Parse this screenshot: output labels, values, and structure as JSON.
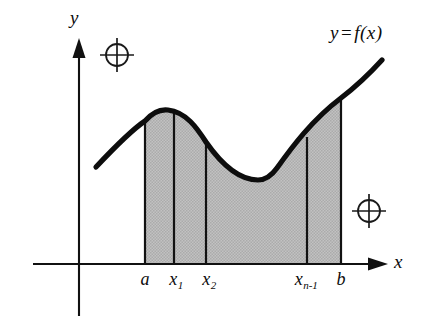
{
  "figure": {
    "background_color": "#ffffff",
    "ink_color": "#111111",
    "shade_color": "#b9b9b9"
  },
  "axes": {
    "y_label": "y",
    "x_label": "x",
    "origin": {
      "x": 79,
      "y": 264
    },
    "x_axis": {
      "x_start": 33,
      "x_end": 388,
      "y": 264
    },
    "y_axis": {
      "x": 79,
      "y_start": 38,
      "y_end": 316
    }
  },
  "curve": {
    "label_y": "y",
    "label_eq": "=",
    "label_f": "f(x)",
    "stroke_color": "#0d0d0d",
    "start_point": {
      "x": 96,
      "y": 167
    },
    "local_max": {
      "x": 168,
      "y": 110
    },
    "local_min": {
      "x": 268,
      "y": 157
    },
    "end_point": {
      "x": 382,
      "y": 60
    }
  },
  "region": {
    "fill_color": "#b9b9b9",
    "left_boundary": 145,
    "right_boundary": 341,
    "baseline": 264
  },
  "partitions": [
    {
      "name": "a",
      "label": "a",
      "sub": null,
      "x": 145
    },
    {
      "name": "x1",
      "label": "x",
      "sub": "1",
      "x": 174
    },
    {
      "name": "x2",
      "label": "x",
      "sub": "2",
      "x": 206
    },
    {
      "name": "xn-1",
      "label": "x",
      "sub": "n-1",
      "x": 307
    },
    {
      "name": "b",
      "label": "b",
      "sub": null,
      "x": 341
    }
  ],
  "registration_marks": [
    {
      "name": "top-left",
      "cx": 117,
      "cy": 55,
      "r": 11
    },
    {
      "name": "bottom-right",
      "cx": 369,
      "cy": 211,
      "r": 11
    }
  ]
}
